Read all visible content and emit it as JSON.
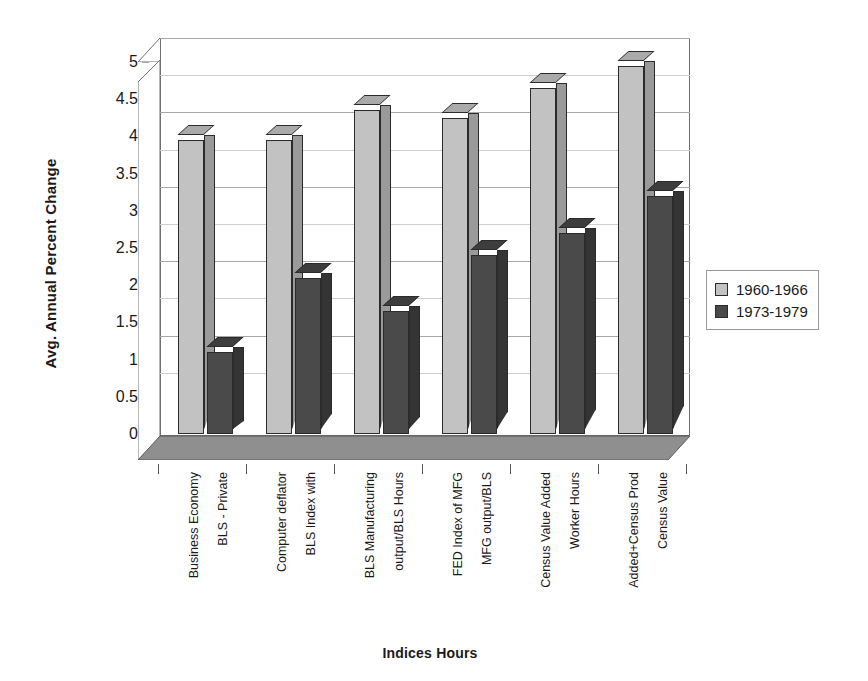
{
  "chart_data": {
    "type": "bar",
    "title": "",
    "xlabel": "Indices Hours",
    "ylabel": "Avg. Annual Percent Change",
    "ylim": [
      0,
      5
    ],
    "yticks": [
      "0",
      "0.5",
      "1",
      "1.5",
      "2",
      "2.5",
      "3",
      "3.5",
      "4",
      "4.5",
      "5"
    ],
    "ytick_values": [
      0,
      0.5,
      1,
      1.5,
      2,
      2.5,
      3,
      3.5,
      4,
      4.5,
      5
    ],
    "grid": true,
    "legend_position": "right",
    "style": "3d-clustered-column",
    "categories": [
      "Business Economy BLS - Private",
      "Computer deflator BLS Index with",
      "BLS Manufacturing output/BLS Hours",
      "FED Index of MFG MFG output/BLS",
      "Census Value Added Worker Hours",
      "Added+Census Prod Census Value"
    ],
    "category_lines": [
      [
        "Business Economy",
        "BLS - Private"
      ],
      [
        "Computer deflator",
        "BLS Index with"
      ],
      [
        "BLS Manufacturing",
        "output/BLS Hours"
      ],
      [
        "FED Index of  MFG",
        "MFG output/BLS"
      ],
      [
        "Census Value Added",
        "Worker Hours"
      ],
      [
        "Added+Census Prod",
        "Census Value"
      ]
    ],
    "series": [
      {
        "name": "1960-1966",
        "color": "#c2c2c2",
        "values": [
          3.95,
          3.95,
          4.35,
          4.25,
          4.65,
          4.95
        ]
      },
      {
        "name": "1973-1979",
        "color": "#4a4a4a",
        "values": [
          1.1,
          2.1,
          1.65,
          2.4,
          2.7,
          3.2
        ]
      }
    ]
  },
  "legend": {
    "items": [
      {
        "label": "1960-1966"
      },
      {
        "label": "1973-1979"
      }
    ]
  }
}
